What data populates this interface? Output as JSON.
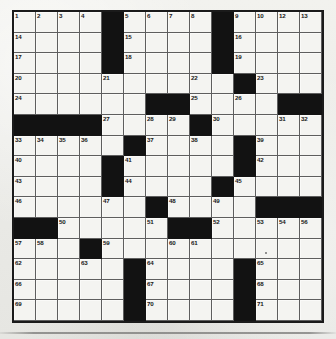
{
  "document": {
    "type": "crossword-puzzle-grid",
    "title": "Crossword Puzzle"
  },
  "grid": {
    "columns": 14,
    "rows": 15,
    "colors": {
      "cell_fill": "#f4f4f1",
      "block_fill": "#121212",
      "border": "#1a1a1a",
      "page_background": "#eeeeea",
      "number_text": "#171717"
    },
    "highest_clue_number": 71,
    "cells": [
      [
        {
          "n": "1"
        },
        {
          "n": "2"
        },
        {
          "n": "3"
        },
        {
          "n": "4"
        },
        {
          "b": true
        },
        {
          "n": "5"
        },
        {
          "n": "6"
        },
        {
          "n": "7"
        },
        {
          "n": "8"
        },
        {
          "b": true
        },
        {
          "n": "9"
        },
        {
          "n": "10"
        },
        {
          "n": "11"
        },
        {
          "n": "12",
          "extra": "13"
        }
      ],
      [
        {
          "n": "14"
        },
        {},
        {},
        {},
        {
          "b": true
        },
        {
          "n": "15"
        },
        {},
        {},
        {},
        {
          "b": true
        },
        {
          "n": "16"
        },
        {},
        {},
        {}
      ],
      [
        {
          "n": "17"
        },
        {},
        {},
        {},
        {
          "b": true
        },
        {
          "n": "18"
        },
        {},
        {},
        {},
        {
          "b": true
        },
        {
          "n": "19"
        },
        {},
        {},
        {}
      ],
      [
        {
          "n": "20"
        },
        {},
        {},
        {},
        {
          "n": "21"
        },
        {},
        {},
        {},
        {
          "n": "22"
        },
        {},
        {
          "b": true
        },
        {
          "n": "23"
        },
        {},
        {}
      ],
      [
        {
          "n": "24"
        },
        {},
        {},
        {},
        {},
        {},
        {
          "b": true
        },
        {
          "b": true
        },
        {
          "n": "25"
        },
        {},
        {
          "n": "26"
        },
        {},
        {
          "b": true
        },
        {
          "b": true
        }
      ],
      [
        {
          "b": true
        },
        {
          "b": true
        },
        {
          "b": true
        },
        {
          "b": true
        },
        {
          "n": "27"
        },
        {},
        {
          "n": "28"
        },
        {
          "n": "29"
        },
        {
          "b": true
        },
        {
          "n": "30"
        },
        {},
        {},
        {
          "n": "31"
        },
        {
          "n": "32"
        }
      ],
      [
        {
          "n": "33"
        },
        {
          "n": "34"
        },
        {
          "n": "35"
        },
        {
          "n": "36"
        },
        {},
        {
          "b": true
        },
        {
          "n": "37"
        },
        {},
        {
          "n": "38"
        },
        {},
        {
          "b": true
        },
        {
          "n": "39"
        },
        {},
        {}
      ],
      [
        {
          "n": "40"
        },
        {},
        {},
        {},
        {
          "b": true
        },
        {
          "n": "41"
        },
        {},
        {},
        {},
        {},
        {
          "b": true
        },
        {
          "n": "42"
        },
        {},
        {}
      ],
      [
        {
          "n": "43"
        },
        {},
        {},
        {},
        {
          "b": true
        },
        {
          "n": "44"
        },
        {},
        {},
        {},
        {
          "b": true
        },
        {
          "n": "45"
        },
        {},
        {},
        {}
      ],
      [
        {
          "n": "46"
        },
        {},
        {},
        {},
        {
          "n": "47"
        },
        {},
        {
          "b": true
        },
        {
          "n": "48"
        },
        {},
        {
          "n": "49"
        },
        {},
        {
          "b": true
        },
        {
          "b": true
        },
        {
          "b": true
        }
      ],
      [
        {
          "b": true
        },
        {
          "b": true
        },
        {
          "n": "50"
        },
        {},
        {},
        {},
        {
          "n": "51"
        },
        {
          "b": true
        },
        {
          "b": true
        },
        {
          "n": "52"
        },
        {},
        {
          "n": "53"
        },
        {
          "n": "54"
        },
        {
          "n": "55"
        }
      ],
      [
        {
          "n": "57"
        },
        {
          "n": "58"
        },
        {},
        {
          "b": true
        },
        {
          "n": "59"
        },
        {},
        {},
        {
          "n": "60"
        },
        {
          "n": "61"
        },
        {},
        {},
        {},
        {},
        {}
      ],
      [
        {
          "n": "62"
        },
        {},
        {},
        {
          "n": "63"
        },
        {},
        {
          "b": true
        },
        {
          "n": "64"
        },
        {},
        {},
        {},
        {
          "b": true
        },
        {
          "n": "65"
        },
        {},
        {}
      ],
      [
        {
          "n": "66"
        },
        {},
        {},
        {},
        {},
        {
          "b": true
        },
        {
          "n": "67"
        },
        {},
        {},
        {},
        {
          "b": true
        },
        {
          "n": "68"
        },
        {},
        {}
      ],
      [
        {
          "n": "69"
        },
        {},
        {},
        {},
        {},
        {
          "b": true
        },
        {
          "n": "70"
        },
        {},
        {},
        {},
        {
          "b": true
        },
        {
          "n": "71"
        },
        {},
        {}
      ]
    ],
    "row_overrides": {
      "note_row_0_col_12": "12",
      "note_row_0_col_13": "13",
      "note_row_10_col_13": "56"
    }
  }
}
